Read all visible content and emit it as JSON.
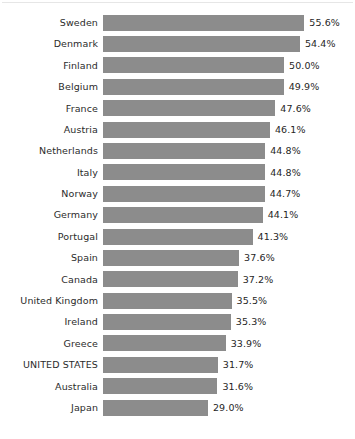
{
  "chart_data": {
    "type": "bar",
    "orientation": "horizontal",
    "title": "",
    "subtitle": "",
    "xlabel": "",
    "ylabel": "",
    "xlim": [
      0,
      60
    ],
    "grid": false,
    "legend": null,
    "value_suffix": "%",
    "bar_color": "#8c8c8c",
    "label_color": "#2b2b2b",
    "value_label_color": "#262626",
    "background_color": "#ffffff",
    "categories": [
      "Sweden",
      "Denmark",
      "Finland",
      "Belgium",
      "France",
      "Austria",
      "Netherlands",
      "Italy",
      "Norway",
      "Germany",
      "Portugal",
      "Spain",
      "Canada",
      "United Kingdom",
      "Ireland",
      "Greece",
      "UNITED STATES",
      "Australia",
      "Japan"
    ],
    "values": [
      55.6,
      54.4,
      50.0,
      49.9,
      47.6,
      46.1,
      44.8,
      44.8,
      44.7,
      44.1,
      41.3,
      37.6,
      37.2,
      35.5,
      35.3,
      33.9,
      31.7,
      31.6,
      29.0
    ],
    "value_labels": [
      "55.6%",
      "54.4%",
      "50.0%",
      "49.9%",
      "47.6%",
      "46.1%",
      "44.8%",
      "44.8%",
      "44.7%",
      "44.1%",
      "41.3%",
      "37.6%",
      "37.2%",
      "35.5%",
      "35.3%",
      "33.9%",
      "31.7%",
      "31.6%",
      "29.0%"
    ]
  }
}
